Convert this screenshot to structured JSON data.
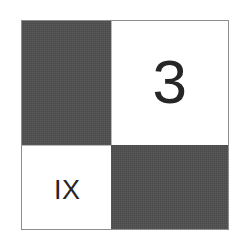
{
  "figure": {
    "kind": "quadrant-checkerboard",
    "background_color": "#ffffff",
    "border_color": "#8d8d8d",
    "dark_fill_color": "#4e4e4e",
    "light_fill_color": "#ffffff",
    "text_color": "#262626"
  },
  "quadrants": {
    "top_left": {
      "name": "top-left",
      "fill": "dark",
      "label": ""
    },
    "top_right": {
      "name": "top-right",
      "fill": "light",
      "label": "3"
    },
    "bottom_left": {
      "name": "bottom-left",
      "fill": "light",
      "label": "IX"
    },
    "bottom_right": {
      "name": "bottom-right",
      "fill": "dark",
      "label": ""
    }
  }
}
